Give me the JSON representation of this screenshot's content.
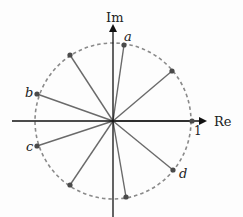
{
  "diagram": {
    "type": "unit-circle-complex-plane",
    "center": [
      113,
      121
    ],
    "radius": 78,
    "colors": {
      "axis": "#111111",
      "circle": "#8a8a8a",
      "spoke": "#6a6a6a",
      "dot": "#4a4a4a",
      "text": "#222222"
    },
    "axes": {
      "x_label": "Re",
      "y_label": "Im",
      "unit_label": "1"
    },
    "points": [
      {
        "x": 192,
        "y": 121,
        "label": "",
        "angle_deg": 0
      },
      {
        "x": 172,
        "y": 71,
        "label": "",
        "angle_deg": 40
      },
      {
        "x": 124,
        "y": 45,
        "label": "a",
        "angle_deg": 82
      },
      {
        "x": 70,
        "y": 55,
        "label": "",
        "angle_deg": 122
      },
      {
        "x": 37,
        "y": 94,
        "label": "b",
        "angle_deg": 160
      },
      {
        "x": 37,
        "y": 146,
        "label": "c",
        "angle_deg": 198
      },
      {
        "x": 70,
        "y": 185,
        "label": "",
        "angle_deg": 238
      },
      {
        "x": 126,
        "y": 197,
        "label": "",
        "angle_deg": 280
      },
      {
        "x": 173,
        "y": 170,
        "label": "d",
        "angle_deg": 320
      }
    ],
    "labels": {
      "a": "a",
      "b": "b",
      "c": "c",
      "d": "d"
    }
  }
}
